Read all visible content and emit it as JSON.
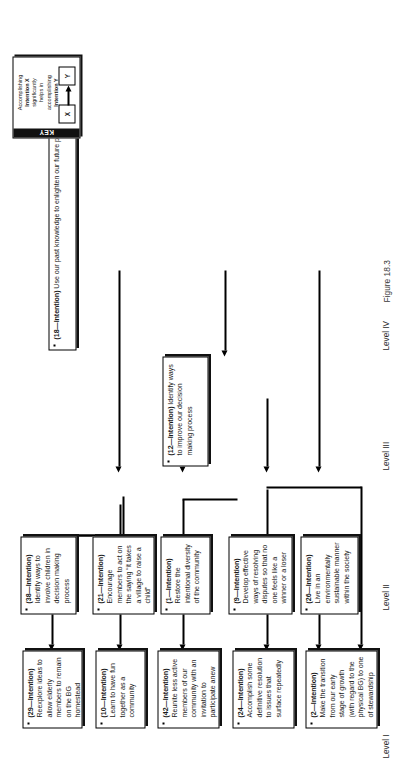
{
  "figure": {
    "caption": "Figure 18.3",
    "levels": [
      {
        "id": "level-1",
        "label": "Level I"
      },
      {
        "id": "level-2",
        "label": "Level II"
      },
      {
        "id": "level-3",
        "label": "Level III"
      },
      {
        "id": "level-4",
        "label": "Level IV"
      }
    ]
  },
  "key": {
    "title": "KEY",
    "description_1": "Accomplishing",
    "description_2": "Intention X",
    "description_3": "significantly",
    "description_4": "helps in",
    "description_5": "accomplishing",
    "description_6": "Intention Y",
    "source_label": "X",
    "target_label": "Y"
  },
  "nodes": [
    {
      "id": "node-29",
      "number": "(29—Intention)",
      "text": "Reexplore ideas to allow elderly members to remain on the BG homestead",
      "level": "Level I"
    },
    {
      "id": "node-10",
      "number": "(10—Intention)",
      "text": "Learn to have fun together as a community",
      "level": "Level I"
    },
    {
      "id": "node-42",
      "number": "(42—Intention)",
      "text": "Reunite less active members of our community with an invitation to participate anew",
      "level": "Level I"
    },
    {
      "id": "node-24",
      "number": "(24—Intention)",
      "text": "Accomplish some definitive resolution to issues that surface repeatedly",
      "level": "Level I"
    },
    {
      "id": "node-2",
      "number": "(2—Intention)",
      "text": "Make the transition from our early stage of growth (with regard to the physical BG) to one of stewardship",
      "level": "Level I"
    },
    {
      "id": "node-38",
      "number": "(38—Intention)",
      "text": "Identify ways to involve children in decision making process",
      "level": "Level II"
    },
    {
      "id": "node-21",
      "number": "(21—Intention)",
      "text": "Encourage members to act on the saying “it takes a village to raise a child”",
      "level": "Level II"
    },
    {
      "id": "node-1",
      "number": "(1—Intention)",
      "text": "Restore the intentional diversity of the community",
      "level": "Level II"
    },
    {
      "id": "node-9",
      "number": "(9—Intention)",
      "text": "Develop effective ways of resolving disputes so that no one feels like a winner or a loser",
      "level": "Level II"
    },
    {
      "id": "node-26",
      "number": "(26—Intention)",
      "text": "Live in an environmentally sustainable manner within the society",
      "level": "Level II"
    },
    {
      "id": "node-12",
      "number": "(12—Intention)",
      "text": "Identify ways to improve our decision making process",
      "level": "Level III"
    },
    {
      "id": "node-18",
      "number": "(18—Intention)",
      "text": "Use our past knowledge to enlighten our future planning",
      "level": "Level IV"
    }
  ]
}
